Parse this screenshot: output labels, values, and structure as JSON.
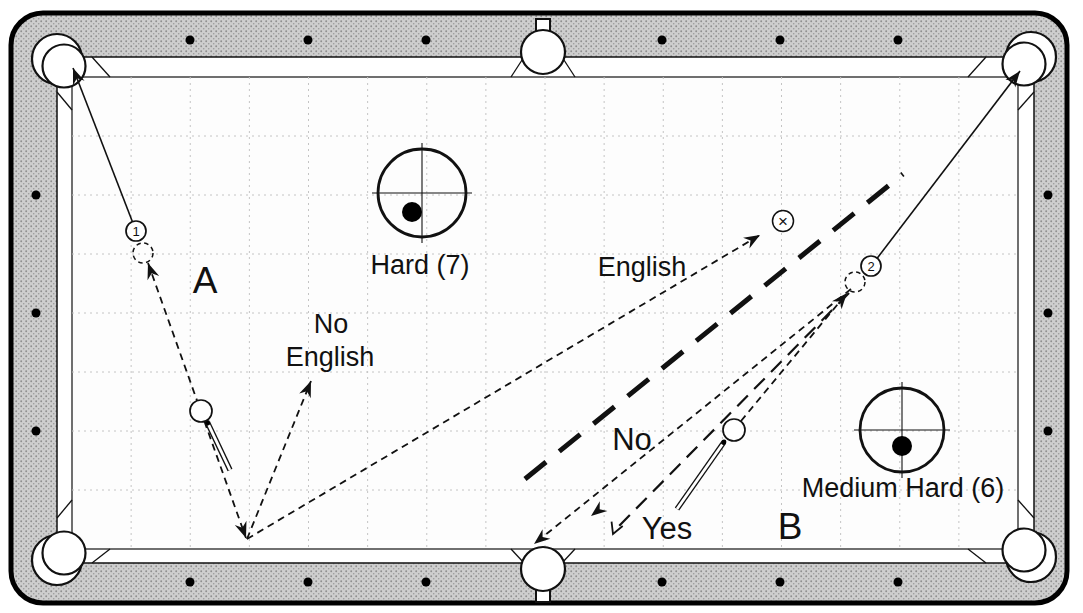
{
  "page": {
    "width": 1083,
    "height": 613,
    "background": "#ffffff"
  },
  "colors": {
    "line": "#111111",
    "border": "#000000",
    "rail_fill": "#cecece",
    "rail_dot": "#8f8f8f",
    "cloth": "#fdfdfd",
    "grid": "#c4c4c4",
    "text": "#111111",
    "white": "#ffffff"
  },
  "table": {
    "border_rect": {
      "x": 11,
      "y": 13,
      "w": 1056,
      "h": 590,
      "rx": 32,
      "stroke_width": 5
    },
    "apron_rect": {
      "x": 57,
      "y": 57,
      "w": 977,
      "h": 506,
      "rx": 6
    },
    "cloth_rect": {
      "x": 72,
      "y": 77,
      "w": 946,
      "h": 472
    },
    "grid": {
      "cols": 16,
      "rows": 8,
      "dash": "2 4"
    },
    "bevels": [
      [
        92,
        57,
        110,
        77
      ],
      [
        57,
        92,
        72,
        110
      ],
      [
        986,
        57,
        968,
        77
      ],
      [
        1034,
        92,
        1018,
        110
      ],
      [
        92,
        563,
        110,
        549
      ],
      [
        57,
        518,
        72,
        500
      ],
      [
        986,
        563,
        968,
        549
      ],
      [
        1034,
        518,
        1018,
        500
      ],
      [
        524,
        57,
        511,
        77
      ],
      [
        562,
        57,
        575,
        77
      ],
      [
        524,
        563,
        511,
        549
      ],
      [
        562,
        563,
        575,
        549
      ]
    ],
    "diamonds": {
      "r": 4.5,
      "top_y": 40,
      "bottom_y": 582,
      "long_x": [
        190,
        308,
        426,
        662,
        780,
        898
      ],
      "left_x": 36,
      "right_x": 1048,
      "side_y": [
        195,
        313,
        431
      ]
    },
    "corner_pockets": [
      {
        "cx": 64,
        "cy": 66,
        "ox": 57,
        "oy": 59
      },
      {
        "cx": 1024,
        "cy": 64,
        "ox": 1031,
        "oy": 57
      },
      {
        "cx": 64,
        "cy": 553,
        "ox": 57,
        "oy": 560
      },
      {
        "cx": 1024,
        "cy": 550,
        "ox": 1031,
        "oy": 557
      }
    ],
    "corner_pocket_r": 21.5,
    "corner_pocket_outer_r": 25,
    "side_pockets": [
      {
        "cx": 543,
        "cy": 52
      },
      {
        "cx": 543,
        "cy": 569
      }
    ],
    "side_pocket_r": 22,
    "pocket_tabs": [
      {
        "x": 536,
        "y": 19,
        "w": 14,
        "h": 16
      },
      {
        "x": 536,
        "y": 586,
        "w": 14,
        "h": 16
      }
    ]
  },
  "path_styles": {
    "solid": {
      "w": 1.6,
      "dash": null
    },
    "fine": {
      "w": 1.8,
      "dash": "7 5"
    },
    "medium": {
      "w": 2.2,
      "dash": "15 9"
    },
    "bold": {
      "w": 5,
      "dash": "27 17"
    }
  },
  "paths": [
    {
      "id": "shot-a-object-ball-to-pocket",
      "style": "solid",
      "x1": 136,
      "y1": 231,
      "x2": 73,
      "y2": 68,
      "arrows": [
        "end"
      ]
    },
    {
      "id": "shot-a-cue-ball-draw-line",
      "style": "fine",
      "x1": 148,
      "y1": 263,
      "x2": 246,
      "y2": 538,
      "arrows": [
        "start",
        "end"
      ]
    },
    {
      "id": "shot-a-no-english-rebound",
      "style": "fine",
      "x1": 247,
      "y1": 539,
      "x2": 311,
      "y2": 381,
      "arrows": [
        "end"
      ]
    },
    {
      "id": "shot-a-english-rebound-to-x",
      "style": "fine",
      "x1": 247,
      "y1": 539,
      "x2": 760,
      "y2": 235,
      "arrows": [
        "end"
      ]
    },
    {
      "id": "shot-b-cue-ball-line",
      "style": "fine",
      "x1": 741,
      "y1": 421,
      "x2": 847,
      "y2": 293,
      "arrows": [
        "end"
      ]
    },
    {
      "id": "shot-b-object-ball-to-pocket",
      "style": "solid",
      "x1": 872,
      "y1": 265,
      "x2": 1020,
      "y2": 71,
      "arrows": [
        "end"
      ]
    },
    {
      "id": "shot-b-scratch-line",
      "style": "fine",
      "x1": 851,
      "y1": 289,
      "x2": 534,
      "y2": 544,
      "arrows": [
        "end"
      ]
    },
    {
      "id": "shot-b-yes-line",
      "style": "medium",
      "x1": 849,
      "y1": 293,
      "x2": 619,
      "y2": 526,
      "arrows": []
    },
    {
      "id": "shot-b-no-line",
      "style": "bold",
      "x1": 525,
      "y1": 479,
      "x2": 903,
      "y2": 174,
      "arrows": []
    }
  ],
  "free_arrows": [
    {
      "id": "scratch-mid-arrow",
      "x": 591,
      "y": 516,
      "angle": 142,
      "kind": "solid"
    },
    {
      "id": "yes-open-arrow",
      "x": 613,
      "y": 534,
      "angle": 112,
      "kind": "open"
    }
  ],
  "balls": [
    {
      "id": "object-ball-1",
      "cx": 136,
      "cy": 231,
      "r": 10,
      "number": "1"
    },
    {
      "id": "object-ball-2",
      "cx": 871,
      "cy": 266,
      "r": 10,
      "number": "2"
    },
    {
      "id": "cue-ball-a",
      "cx": 201,
      "cy": 411,
      "r": 11,
      "number": ""
    },
    {
      "id": "cue-ball-b",
      "cx": 734,
      "cy": 430,
      "r": 11,
      "number": ""
    }
  ],
  "ghost_balls": [
    {
      "id": "ghost-ball-a",
      "cx": 143,
      "cy": 253,
      "r": 10
    },
    {
      "id": "ghost-ball-b",
      "cx": 855,
      "cy": 282,
      "r": 10
    }
  ],
  "target_marker": {
    "id": "position-target-x",
    "cx": 783,
    "cy": 221,
    "r": 10.5,
    "symbol": "×"
  },
  "cue_sticks": [
    {
      "id": "cue-stick-a",
      "x1": 207.5,
      "y1": 422.5,
      "x2": 230,
      "y2": 470
    },
    {
      "id": "cue-stick-b",
      "x1": 724,
      "y1": 442,
      "x2": 677,
      "y2": 509
    }
  ],
  "stroke_indicators": [
    {
      "id": "stroke-hard",
      "cx": 422,
      "cy": 193,
      "r": 44,
      "dot_dx": -10,
      "dot_dy": 19,
      "dot_r": 10,
      "caption": "Hard (7)",
      "caption_x": 420,
      "caption_y": 274
    },
    {
      "id": "stroke-medium-hard",
      "cx": 902,
      "cy": 430,
      "r": 42,
      "dot_dx": 0,
      "dot_dy": 16,
      "dot_r": 10,
      "caption": "Medium Hard (6)",
      "caption_x": 903,
      "caption_y": 497
    }
  ],
  "labels": [
    {
      "id": "label-a",
      "text": "A",
      "x": 205,
      "y": 293,
      "size": 37
    },
    {
      "id": "label-b",
      "text": "B",
      "x": 790,
      "y": 539,
      "size": 37
    },
    {
      "id": "label-no-english-line1",
      "text": "No",
      "x": 331,
      "y": 333,
      "size": 27
    },
    {
      "id": "label-no-english-line2",
      "text": "English",
      "x": 330,
      "y": 366,
      "size": 27
    },
    {
      "id": "label-english",
      "text": "English",
      "x": 642,
      "y": 276,
      "size": 27
    },
    {
      "id": "label-no",
      "text": "No",
      "x": 632,
      "y": 450,
      "size": 31
    },
    {
      "id": "label-yes",
      "text": "Yes",
      "x": 667,
      "y": 539,
      "size": 31
    }
  ]
}
